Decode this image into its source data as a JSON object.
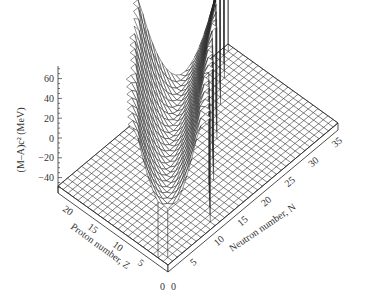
{
  "chart_data": {
    "type": "surface3d",
    "title": "",
    "zlabel": "(M–A)c² (MeV)",
    "xlabel": "Neutron number, N",
    "ylabel": "Proton number, Z",
    "z_ticks": [
      60,
      40,
      20,
      0,
      -20,
      -40
    ],
    "z_range": [
      -50,
      70
    ],
    "n_ticks": [
      0,
      5,
      10,
      15,
      20,
      25,
      30,
      35
    ],
    "z_proton_ticks": [
      0,
      5,
      10,
      15,
      20
    ],
    "n_range": [
      0,
      36
    ],
    "proton_range": [
      0,
      22
    ],
    "grid": true,
    "surface_samples": [
      {
        "Z": 2,
        "N": 2,
        "mass_excess_MeV": 2.4
      },
      {
        "Z": 6,
        "N": 6,
        "mass_excess_MeV": 0.0
      },
      {
        "Z": 8,
        "N": 8,
        "mass_excess_MeV": -4.7
      },
      {
        "Z": 10,
        "N": 10,
        "mass_excess_MeV": -7.0
      },
      {
        "Z": 12,
        "N": 12,
        "mass_excess_MeV": -13.9
      },
      {
        "Z": 14,
        "N": 14,
        "mass_excess_MeV": -21.5
      },
      {
        "Z": 16,
        "N": 16,
        "mass_excess_MeV": -26.0
      },
      {
        "Z": 18,
        "N": 20,
        "mass_excess_MeV": -34.7
      },
      {
        "Z": 20,
        "N": 20,
        "mass_excess_MeV": -34.8
      }
    ]
  },
  "labels": {
    "z_axis_title": "(M–A)c² (MeV)",
    "proton_axis_title": "Proton number, Z",
    "neutron_axis_title": "Neutron number, N",
    "origin_z": "0",
    "origin_n": "0"
  }
}
